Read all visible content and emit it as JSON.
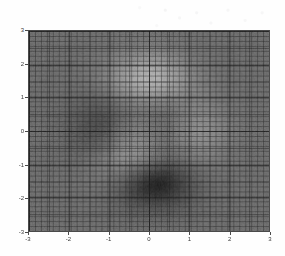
{
  "figure": {
    "background_color": "#fefefe",
    "plot_background_color": "#7a7a7a",
    "axis_line_color": "#4a4a4a",
    "tick_text_color": "#3a3a3a"
  },
  "chart_data": {
    "type": "heatmap",
    "title": "",
    "subtitle": "",
    "xlabel": "",
    "ylabel": "",
    "colormap": "gray",
    "grid": true,
    "grid_color": "#3c3c3c",
    "legend": "none",
    "xlim": [
      -3,
      3
    ],
    "ylim": [
      -3,
      3
    ],
    "xticks": [
      -3,
      -2,
      -1,
      0,
      1,
      2,
      3
    ],
    "yticks": [
      -3,
      -2,
      -1,
      0,
      1,
      2,
      3
    ],
    "xtick_labels": [
      "-3",
      "-2",
      "-1",
      "0",
      "1",
      "2",
      "3"
    ],
    "ytick_labels": [
      "-3",
      "-2",
      "-1",
      "0",
      "1",
      "2",
      "3"
    ],
    "mesh": {
      "nx": 40,
      "ny": 40
    },
    "function": "peaks",
    "zlim": [
      -6.5,
      8.1
    ],
    "annotations": [
      {
        "label": "bright peak",
        "x": -0.3,
        "y": 1.6,
        "value": 8.1
      },
      {
        "label": "dark valley",
        "x": 0.3,
        "y": -1.6,
        "value": -6.5
      },
      {
        "label": "secondary lobe",
        "x": -1.4,
        "y": 0.2,
        "value": 3.2
      }
    ],
    "z_sample_grid_note": "values generated from the peaks surface over the plotted domain"
  },
  "axes": {
    "y_ticks": [
      {
        "label": "3",
        "value": 3
      },
      {
        "label": "2",
        "value": 2
      },
      {
        "label": "1",
        "value": 1
      },
      {
        "label": "0",
        "value": 0
      },
      {
        "label": "-1",
        "value": -1
      },
      {
        "label": "-2",
        "value": -2
      },
      {
        "label": "-3",
        "value": -3
      }
    ],
    "x_ticks": [
      {
        "label": "-3",
        "value": -3
      },
      {
        "label": "-2",
        "value": -2
      },
      {
        "label": "-1",
        "value": -1
      },
      {
        "label": "0",
        "value": 0
      },
      {
        "label": "1",
        "value": 1
      },
      {
        "label": "2",
        "value": 2
      },
      {
        "label": "3",
        "value": 3
      }
    ]
  }
}
